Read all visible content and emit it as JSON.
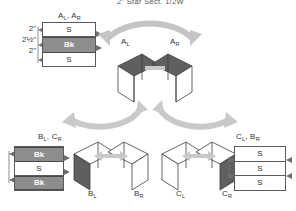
{
  "title": "2\" Star Sect. 1/2W",
  "colors": {
    "ink": "#333333",
    "line": "#5a5a5a",
    "bk_fill": "#8d8d8d",
    "s_fill": "#ffffff",
    "arrow": "#bdbdbd",
    "dark_face": "#5f5f5f",
    "page_bg": "#ffffff"
  },
  "dimensions": {
    "top": "2\"",
    "middle": "2½\"",
    "bottom": "2\""
  },
  "groups": {
    "a": {
      "stack_label": "A",
      "stack_label_sub1": "L",
      "stack_label_sub2": "R",
      "stack_label_full": "Aʟ, Aʀ",
      "rows": [
        {
          "text": "S",
          "kind": "s"
        },
        {
          "text": "Bk",
          "kind": "bk"
        },
        {
          "text": "S",
          "kind": "s"
        }
      ],
      "figure_left": "A",
      "figure_left_sub": "L",
      "figure_right": "A",
      "figure_right_sub": "R"
    },
    "b": {
      "stack_label_full": "Bʟ, Cʀ",
      "stack_label": "B",
      "stack_label_sub1": "L",
      "stack_label_sub2": "R",
      "rows": [
        {
          "text": "Bk",
          "kind": "bk"
        },
        {
          "text": "S",
          "kind": "s"
        },
        {
          "text": "Bk",
          "kind": "bk"
        }
      ],
      "figure_left": "B",
      "figure_left_sub": "L",
      "figure_right": "B",
      "figure_right_sub": "R"
    },
    "c": {
      "stack_label_full": "Cʟ, Bʀ",
      "stack_label": "C",
      "stack_label_sub1": "L",
      "stack_label_sub2": "R",
      "rows": [
        {
          "text": "S",
          "kind": "s"
        },
        {
          "text": "S",
          "kind": "s"
        },
        {
          "text": "S",
          "kind": "s"
        }
      ],
      "figure_left": "C",
      "figure_left_sub": "L",
      "figure_right": "C",
      "figure_right_sub": "R"
    }
  },
  "labels": {
    "a_stack": "A",
    "a_stack_r": "A",
    "b_stack": "B",
    "b_stack_r": "C",
    "c_stack": "C",
    "c_stack_r": "B",
    "sub_l": "L",
    "sub_r": "R",
    "comma": ", "
  },
  "icons": {
    "curved_arrow": "curved-double-arrow-icon",
    "straight_arrow": "double-headed-arrow-icon",
    "bracket": "dimension-bracket-icon"
  }
}
